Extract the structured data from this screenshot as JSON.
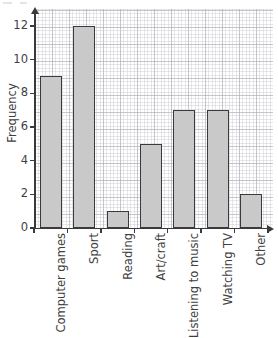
{
  "chart_data": {
    "type": "bar",
    "title": "",
    "subtitle": "",
    "xlabel": "",
    "ylabel": "Frequency",
    "categories": [
      "Computer games",
      "Sport",
      "Reading",
      "Art/craft",
      "Listening to music",
      "Watching TV",
      "Other"
    ],
    "values": [
      9,
      12,
      1,
      5,
      7,
      7,
      2
    ],
    "ylim": [
      0,
      13
    ],
    "y_ticks": [
      0,
      2,
      4,
      6,
      8,
      10,
      12
    ],
    "y_tick_labels": [
      "0",
      "2",
      "4",
      "6",
      "8",
      "10",
      "12"
    ],
    "grid": true,
    "grid_style": "graph-paper",
    "legend": false,
    "legend_position": "none",
    "bar_fill_color": "#c9c9c9",
    "bar_edge_color": "#3a3a3a",
    "axis_color": "#3a3a3a",
    "grid_major_color": "#aaaab2",
    "grid_minor_color": "#c4c4cc",
    "background_color": "#ffffff",
    "text_color": "#3f3f3f",
    "x_tick_label_rotation": -90,
    "axis_arrows": true
  },
  "axes": {
    "y_title": "Frequency"
  }
}
